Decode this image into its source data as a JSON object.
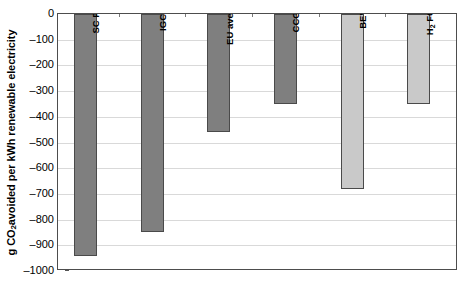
{
  "chart_data": {
    "type": "bar",
    "title": "",
    "xlabel": "",
    "ylabel": "g CO2 avoided per kWh renewable electricity",
    "ylabel_parts": {
      "prefix": "g CO",
      "sub": "2",
      "suffix": " avoided per kWh renewable electricity"
    },
    "categories": [
      "SC PC",
      "IGCC",
      "EU average",
      "CCGT",
      "BEV",
      "H2 FCV"
    ],
    "values": [
      -940,
      -850,
      -460,
      -350,
      -680,
      -350
    ],
    "ylim": [
      -1000,
      0
    ],
    "ytick_values": [
      0,
      -100,
      -200,
      -300,
      -400,
      -500,
      -600,
      -700,
      -800,
      -900,
      -1000
    ],
    "ytick_labels": [
      "0",
      "–100",
      "–200",
      "–300",
      "–400",
      "–500",
      "–600",
      "–700",
      "–800",
      "–900",
      "–1000"
    ],
    "grid": true,
    "legend": false,
    "bar_colors": [
      "#7f7f7f",
      "#7f7f7f",
      "#7f7f7f",
      "#7f7f7f",
      "#c9c9c9",
      "#c9c9c9"
    ],
    "bar_label_colors": [
      "#000000",
      "#000000",
      "#000000",
      "#000000",
      "#000000",
      "#000000"
    ],
    "bars": [
      {
        "label": "SC PC",
        "value": -940,
        "color": "#7f7f7f",
        "label_sub": ""
      },
      {
        "label": "IGCC",
        "value": -850,
        "color": "#7f7f7f",
        "label_sub": ""
      },
      {
        "label": "EU average",
        "value": -460,
        "color": "#7f7f7f",
        "label_sub": ""
      },
      {
        "label": "CCGT",
        "value": -350,
        "color": "#7f7f7f",
        "label_sub": ""
      },
      {
        "label": "BEV",
        "value": -680,
        "color": "#c9c9c9",
        "label_sub": ""
      },
      {
        "label": "H",
        "value": -350,
        "color": "#c9c9c9",
        "label_sub": "2",
        "label_suffix": " FCV"
      }
    ]
  },
  "style": {
    "frame_color": "#4d4d4d",
    "grid_color": "#d9d9d9",
    "background": "#ffffff",
    "text_color": "#000000"
  }
}
